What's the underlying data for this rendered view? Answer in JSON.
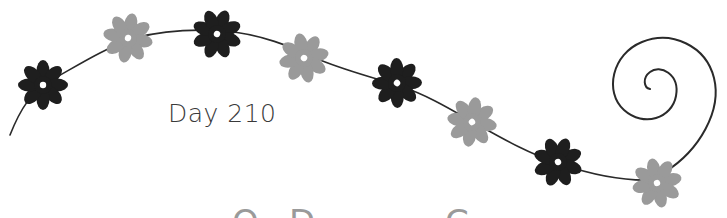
{
  "page": {
    "label": "Day 210",
    "cutoff_glyphs": [
      {
        "text": "O",
        "x": 232
      },
      {
        "text": "D",
        "x": 289
      },
      {
        "text": "C",
        "x": 445
      }
    ]
  },
  "colors": {
    "background": "#ffffff",
    "vine": "#2a2a2a",
    "dark_flower": "#1e1e1e",
    "gray_flower": "#9a9a9a",
    "text": "#3a3a3a"
  },
  "flowers": [
    {
      "x": 43,
      "y": 85,
      "tone": "dark"
    },
    {
      "x": 128,
      "y": 38,
      "tone": "gray"
    },
    {
      "x": 217,
      "y": 34,
      "tone": "dark"
    },
    {
      "x": 304,
      "y": 58,
      "tone": "gray"
    },
    {
      "x": 397,
      "y": 83,
      "tone": "dark"
    },
    {
      "x": 472,
      "y": 122,
      "tone": "gray"
    },
    {
      "x": 558,
      "y": 162,
      "tone": "dark"
    },
    {
      "x": 657,
      "y": 183,
      "tone": "gray"
    }
  ]
}
